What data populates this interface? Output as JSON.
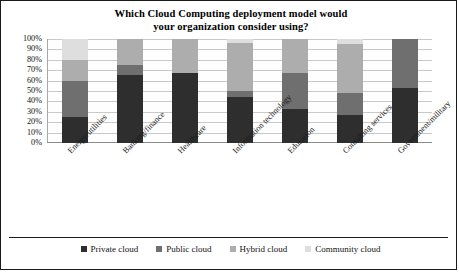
{
  "chart_data": {
    "type": "bar",
    "stacked": true,
    "stacked_mode": "percent",
    "title": "Which Cloud Computing deployment model would your organization consider using?",
    "title_line1": "Which Cloud Computing deployment model would",
    "title_line2": "your organization consider using?",
    "xlabel": "",
    "ylabel": "",
    "ylim": [
      0,
      100
    ],
    "ytick_labels": [
      "100%",
      "90%",
      "80%",
      "70%",
      "60%",
      "50%",
      "40%",
      "30%",
      "20%",
      "10%",
      "0%"
    ],
    "ytick_values": [
      100,
      90,
      80,
      70,
      60,
      50,
      40,
      30,
      20,
      10,
      0
    ],
    "grid": true,
    "legend_position": "bottom",
    "categories": [
      "Energy/utilities",
      "Banking/finance",
      "Healthcare",
      "Information technology",
      "Education",
      "Consulting services",
      "Government/military"
    ],
    "series": [
      {
        "name": "Private cloud",
        "color": "#2e2e2e",
        "values": [
          25,
          65,
          67,
          44,
          33,
          27,
          53
        ]
      },
      {
        "name": "Public cloud",
        "color": "#6f6f6f",
        "values": [
          35,
          10,
          0,
          6,
          34,
          21,
          47
        ]
      },
      {
        "name": "Hybrid cloud",
        "color": "#adadad",
        "values": [
          20,
          25,
          33,
          46,
          33,
          47,
          0
        ]
      },
      {
        "name": "Community cloud",
        "color": "#dedede",
        "values": [
          20,
          0,
          0,
          4,
          0,
          5,
          0
        ]
      }
    ]
  },
  "legend": {
    "items": [
      {
        "label": "Private cloud"
      },
      {
        "label": "Public cloud"
      },
      {
        "label": "Hybrid cloud"
      },
      {
        "label": "Community cloud"
      }
    ]
  }
}
